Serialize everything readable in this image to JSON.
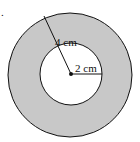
{
  "diagram": {
    "type": "annulus",
    "fill_color": "#c8c8c8",
    "stroke_color": "#111111",
    "outer_radius_label": "4 cm",
    "inner_radius_label": "2 cm",
    "corner_mark": "."
  }
}
